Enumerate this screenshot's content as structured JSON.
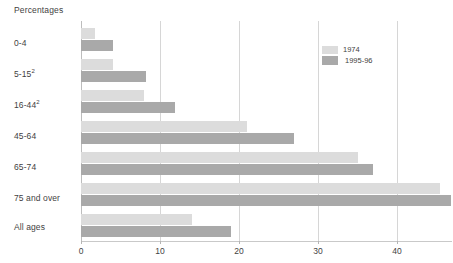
{
  "chart_data": {
    "type": "bar",
    "orientation": "horizontal",
    "title": "Percentages",
    "xlabel": "",
    "ylabel": "",
    "xlim": [
      0,
      48.5
    ],
    "xticks": [
      0,
      10,
      20,
      30,
      40
    ],
    "xtick_labels": [
      "0",
      "10",
      "20",
      "30",
      "40"
    ],
    "grid": true,
    "grid_axis": "x",
    "legend_position": "top-right",
    "categories": [
      "0-4",
      "5-15²",
      "16-44²",
      "45-64",
      "65-74",
      "75 and over",
      "All ages"
    ],
    "series": [
      {
        "name": "1974",
        "color": "#dcdcdc",
        "values": [
          1.8,
          4.0,
          8.0,
          21.0,
          35.0,
          45.5,
          14.0
        ]
      },
      {
        "name": "1995-96",
        "color": "#a9a9a9",
        "values": [
          4.0,
          8.2,
          11.9,
          27.0,
          37.0,
          46.8,
          19.0
        ]
      }
    ]
  },
  "legend": {
    "entries": [
      {
        "label": "1974",
        "swatch_name": "legend-swatch-1974"
      },
      {
        "label": "1995-96",
        "swatch_name": "legend-swatch-1995-96"
      }
    ]
  },
  "colors": {
    "series_1974": "#dcdcdc",
    "series_1995_96": "#a9a9a9",
    "gridline": "#d6d6d6",
    "axis": "#bdbdbd",
    "text": "#3f3f3f",
    "background": "#ffffff"
  }
}
